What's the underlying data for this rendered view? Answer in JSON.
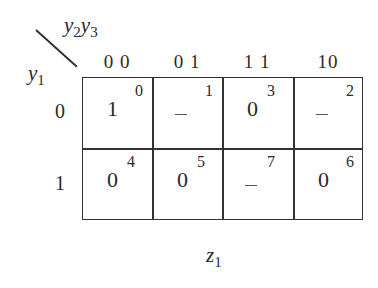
{
  "kmap": {
    "col_var": "y",
    "col_var_sub1": "2",
    "col_var2": "y",
    "col_var_sub2": "3",
    "row_var": "y",
    "row_var_sub": "1",
    "col_headers": [
      "0 0",
      "0 1",
      "1 1",
      "10"
    ],
    "row_headers": [
      "0",
      "1"
    ],
    "cells": [
      [
        {
          "index": "0",
          "value": "1"
        },
        {
          "index": "1",
          "value": "–"
        },
        {
          "index": "3",
          "value": "0"
        },
        {
          "index": "2",
          "value": "–"
        }
      ],
      [
        {
          "index": "4",
          "value": "0"
        },
        {
          "index": "5",
          "value": "0"
        },
        {
          "index": "7",
          "value": "–"
        },
        {
          "index": "6",
          "value": "0"
        }
      ]
    ],
    "output_var": "z",
    "output_sub": "1"
  }
}
